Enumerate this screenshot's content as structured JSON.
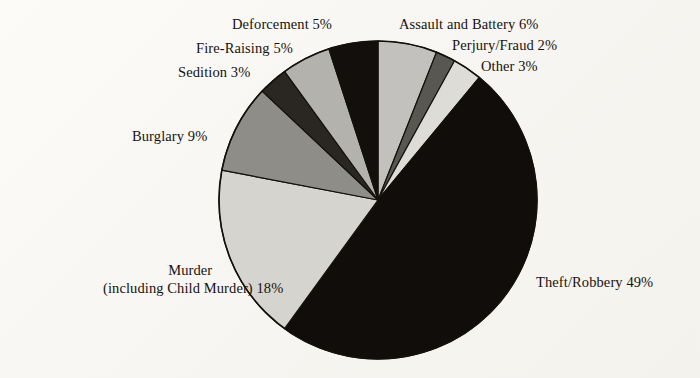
{
  "figure": {
    "background_color": "#faf8f4",
    "outline_color": "#14110d"
  },
  "chart_data": {
    "type": "pie",
    "title": "",
    "subtitle": "",
    "xlabel": "",
    "ylabel": "",
    "grid": false,
    "legend_position": "none",
    "label_format": "{name} {value}%",
    "start_angle_deg": 0,
    "direction": "clockwise",
    "units": "percent",
    "total": 100,
    "categories": [
      "Assault and Battery",
      "Perjury/Fraud",
      "Other",
      "Theft/Robbery",
      "Murder (including Child Murder)",
      "Burglary",
      "Sedition",
      "Fire-Raising",
      "Deforcement"
    ],
    "values": [
      6,
      2,
      3,
      49,
      18,
      9,
      3,
      5,
      5
    ],
    "slices": [
      {
        "name": "Assault and Battery",
        "value": 6,
        "label": "Assault and Battery 6%",
        "color": "#c3c1bd",
        "start_deg": 0.0,
        "end_deg": 21.6
      },
      {
        "name": "Perjury/Fraud",
        "value": 2,
        "label": "Perjury/Fraud 2%",
        "color": "#595751",
        "start_deg": 21.6,
        "end_deg": 28.8
      },
      {
        "name": "Other",
        "value": 3,
        "label": "Other 3%",
        "color": "#dedcd7",
        "start_deg": 28.8,
        "end_deg": 39.6
      },
      {
        "name": "Theft/Robbery",
        "value": 49,
        "label": "Theft/Robbery 49%",
        "color": "#100d0a",
        "start_deg": 39.6,
        "end_deg": 216.0
      },
      {
        "name": "Murder",
        "value": 18,
        "label": "Murder (including Child Murder) 18%",
        "color": "#d6d4cf",
        "start_deg": 216.0,
        "end_deg": 280.8
      },
      {
        "name": "Burglary",
        "value": 9,
        "label": "Burglary 9%",
        "color": "#8f8d87",
        "start_deg": 280.8,
        "end_deg": 313.2
      },
      {
        "name": "Sedition",
        "value": 3,
        "label": "Sedition 3%",
        "color": "#2a2723",
        "start_deg": 313.2,
        "end_deg": 324.0
      },
      {
        "name": "Fire-Raising",
        "value": 5,
        "label": "Fire-Raising 5%",
        "color": "#b4b2ad",
        "start_deg": 324.0,
        "end_deg": 342.0
      },
      {
        "name": "Deforcement",
        "value": 5,
        "label": "Deforcement 5%",
        "color": "#120f0c",
        "start_deg": 342.0,
        "end_deg": 360.0
      }
    ]
  },
  "labels": {
    "deforcement": "Deforcement 5%",
    "fire_raising": "Fire-Raising 5%",
    "sedition": "Sedition 3%",
    "burglary": "Burglary 9%",
    "murder_line1": "Murder",
    "murder_line2": "(including Child Murder) 18%",
    "theft_robbery": "Theft/Robbery 49%",
    "assault_battery": "Assault and Battery 6%",
    "perjury_fraud": "Perjury/Fraud 2%",
    "other": "Other 3%"
  }
}
